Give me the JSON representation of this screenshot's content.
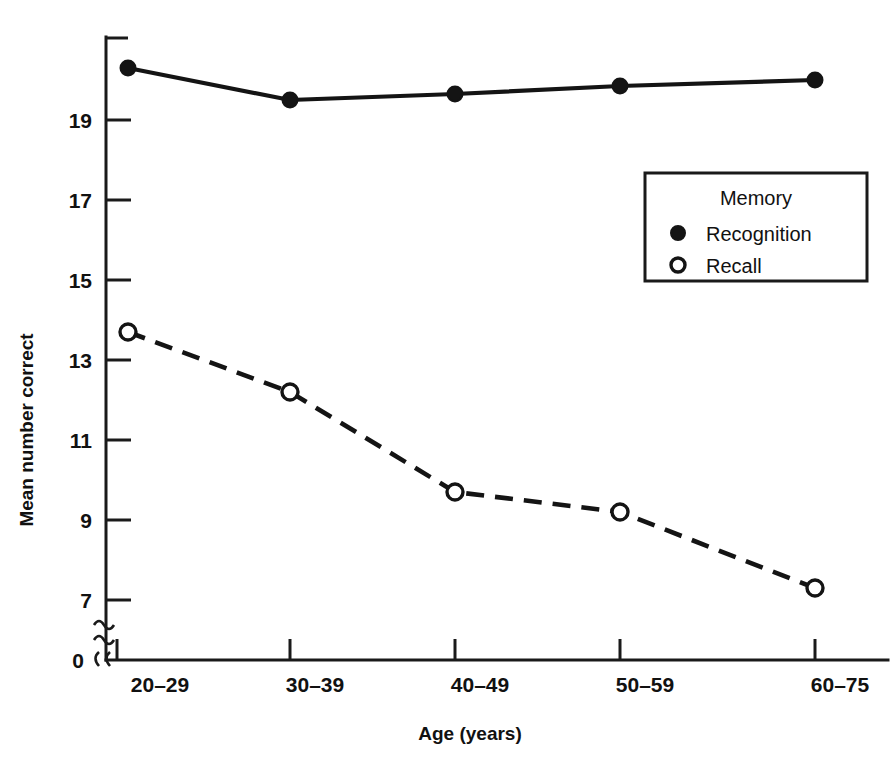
{
  "chart_data": {
    "type": "line",
    "title": "",
    "xlabel": "Age (years)",
    "ylabel": "Mean number correct",
    "categories": [
      "20–29",
      "30–39",
      "40–49",
      "50–59",
      "60–75"
    ],
    "series": [
      {
        "name": "Recognition",
        "marker": "filled-circle",
        "line_style": "solid",
        "values": [
          20.3,
          19.5,
          19.65,
          19.85,
          20.0
        ]
      },
      {
        "name": "Recall",
        "marker": "open-circle",
        "line_style": "dashed",
        "values": [
          13.7,
          12.2,
          9.7,
          9.2,
          7.3
        ]
      }
    ],
    "ylim": [
      7,
      20.75
    ],
    "y_ticks": [
      7,
      9,
      11,
      13,
      15,
      17,
      19
    ],
    "y_tick_labels": [
      "7",
      "9",
      "11",
      "13",
      "15",
      "17",
      "19"
    ],
    "y_origin_label": "0",
    "axis_break": true,
    "grid": false,
    "legend_position": "inside-upper-right",
    "legend_title": "Memory",
    "color": "#141414"
  },
  "axes": {
    "y_label": "Mean number correct",
    "x_label": "Age (years)",
    "y_ticks": [
      "19",
      "17",
      "15",
      "13",
      "11",
      "9",
      "7"
    ],
    "y_zero": "0",
    "x_ticks": [
      "20–29",
      "30–39",
      "40–49",
      "50–59",
      "60–75"
    ]
  },
  "legend": {
    "title": "Memory",
    "items": [
      {
        "label": "Recognition",
        "marker": "filled-circle"
      },
      {
        "label": "Recall",
        "marker": "open-circle"
      }
    ]
  }
}
